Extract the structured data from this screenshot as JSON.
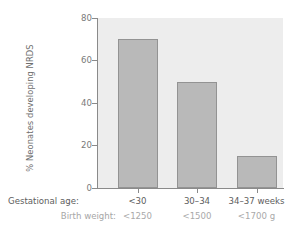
{
  "chart_data": {
    "type": "bar",
    "title": "",
    "subtitle": "",
    "xlabel": "",
    "ylabel": "% Neonates developing NRDS",
    "ylim": [
      0,
      80
    ],
    "yticks": [
      "0",
      "20",
      "40",
      "60",
      "80"
    ],
    "ytick_values": [
      0,
      20,
      40,
      60,
      80
    ],
    "grid": false,
    "legend": "none",
    "categories": [
      "<30",
      "30–34",
      "34–37 weeks"
    ],
    "values": [
      70,
      50,
      15
    ],
    "series": [
      {
        "name": "% Neonates developing NRDS",
        "values": [
          70,
          50,
          15
        ]
      }
    ],
    "secondary_category_label": "Birth weight:",
    "primary_category_label": "Gestational age:",
    "secondary_categories": [
      "<1250",
      "<1500",
      "<1700 g"
    ],
    "bar_color": "#b9b9b9",
    "bar_border_color": "#939393",
    "plot_background": "#ededed",
    "axis_color": "#8a8a8a"
  },
  "axis": {
    "y_title": "% Neonates developing NRDS",
    "ticks": [
      {
        "label": "80",
        "value": 80
      },
      {
        "label": "60",
        "value": 60
      },
      {
        "label": "40",
        "value": 40
      },
      {
        "label": "20",
        "value": 20
      },
      {
        "label": "0",
        "value": 0
      }
    ]
  },
  "xlabels": {
    "gestational_title": "Gestational age:",
    "weight_title": "Birth weight:",
    "gestational": [
      "<30",
      "30–34",
      "34–37 weeks"
    ],
    "weight": [
      "<1250",
      "<1500",
      "<1700 g"
    ]
  }
}
